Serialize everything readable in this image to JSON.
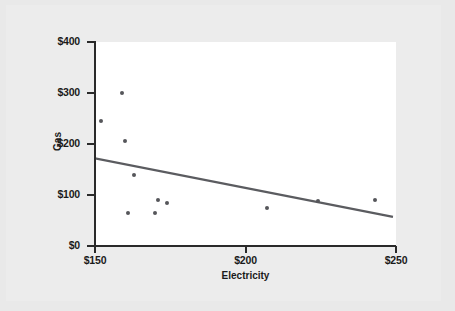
{
  "chart_data": {
    "type": "scatter",
    "title": "",
    "xlabel": "Electricity",
    "ylabel": "Gas",
    "xlim": [
      150,
      250
    ],
    "ylim": [
      0,
      400
    ],
    "grid": false,
    "legend": null,
    "x_ticks": [
      "$150",
      "$200",
      "$250"
    ],
    "x_tick_values": [
      150,
      200,
      250
    ],
    "y_ticks": [
      "$0",
      "$100",
      "$200",
      "$300",
      "$400"
    ],
    "y_tick_values": [
      0,
      100,
      200,
      300,
      400
    ],
    "points": [
      {
        "x": 152,
        "y": 245
      },
      {
        "x": 159,
        "y": 300
      },
      {
        "x": 160,
        "y": 205
      },
      {
        "x": 161,
        "y": 65
      },
      {
        "x": 163,
        "y": 140
      },
      {
        "x": 170,
        "y": 65
      },
      {
        "x": 171,
        "y": 90
      },
      {
        "x": 174,
        "y": 85
      },
      {
        "x": 207,
        "y": 75
      },
      {
        "x": 224,
        "y": 88
      },
      {
        "x": 243,
        "y": 90
      }
    ],
    "trend_line": {
      "x0": 150,
      "y0": 172,
      "x1": 249,
      "y1": 57
    },
    "colors": {
      "point": "#55565a",
      "trend": "#5b5c60",
      "axis": "#2a2a2a",
      "plot_background": "#ffffff",
      "page_background": "#ececec"
    }
  }
}
